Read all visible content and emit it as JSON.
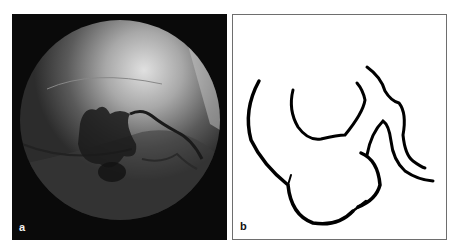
{
  "figure": {
    "panels": [
      {
        "id": "a",
        "label": "a",
        "description": "Circular fluoroscopic/angiographic image showing dark tortuous contrast-filled vessel against grey background with bright upper-right area"
      },
      {
        "id": "b",
        "label": "b",
        "description": "Schematic line drawing tracing the outline of the vessel structure shown in panel a"
      }
    ]
  }
}
